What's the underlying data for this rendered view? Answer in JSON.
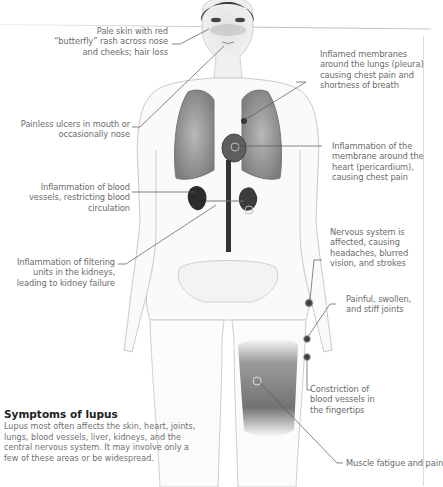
{
  "figure": {
    "title": "Symptoms of lupus",
    "description": "Lupus most often affects the skin, heart, joints, lungs, blood vessels, liver, kidneys, and the central nervous system. It may involve only a few of these areas or be widespread."
  },
  "labels": {
    "skin": "Pale skin with red “butterfly” rash across nose and cheeks; hair loss",
    "ulcers": "Painless ulcers in mouth or occasionally nose",
    "vessels": "Inflammation of blood vessels, restricting blood circulation",
    "kidneys": "Inflammation of filtering units in the kidneys, leading to kidney failure",
    "pleura": "Inflamed membranes around the lungs (pleura) causing chest pain and shortness of breath",
    "pericardium": "Inflammation of the membrane around the heart (pericardium), causing chest pain",
    "nervous": "Nervous system is affected, causing headaches, blurred vision, and strokes",
    "joints": "Painful, swollen, and stiff joints",
    "fingertips": "Constriction of blood vessels in the fingertips",
    "muscle": "Muscle fatigue and pain"
  },
  "colors": {
    "body_outline": "#c9c9c9",
    "organ_dark": "#3a3a3a",
    "leader_line": "#555555",
    "text": "#6b6b6b",
    "title": "#222222"
  }
}
